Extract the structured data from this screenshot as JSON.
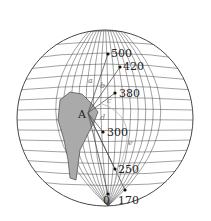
{
  "diagram": {
    "point_A": "A",
    "points": [
      {
        "label": "500",
        "x": 108,
        "y": 54
      },
      {
        "label": "420",
        "x": 120,
        "y": 67
      },
      {
        "label": "380",
        "x": 115,
        "y": 93
      },
      {
        "label": "300",
        "x": 103,
        "y": 132
      },
      {
        "label": "250",
        "x": 115,
        "y": 169
      },
      {
        "label": "0",
        "x": 108,
        "y": 194
      },
      {
        "label": "170",
        "x": 125,
        "y": 190
      }
    ],
    "line_labels": [
      "a",
      "b",
      "c",
      "d",
      "e"
    ]
  }
}
